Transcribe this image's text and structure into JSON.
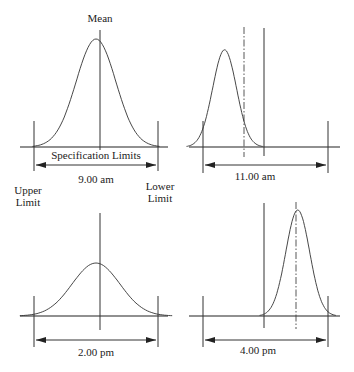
{
  "labels": {
    "mean": "Mean",
    "spec_limits": "Specification Limits",
    "upper_limit_1": "Upper",
    "upper_limit_2": "Limit",
    "lower_limit_1": "Lower",
    "lower_limit_2": "Limit"
  },
  "panels": [
    {
      "id": "p1",
      "time": "9.00 am",
      "mean_offset": 0.0,
      "spread": 1.0,
      "height": 1.0,
      "target_style": "solid",
      "shift_line": false
    },
    {
      "id": "p2",
      "time": "11.00 am",
      "mean_offset": -0.33,
      "spread": 0.6,
      "height": 0.9,
      "target_style": "dashdot",
      "shift_line": true
    },
    {
      "id": "p3",
      "time": "2.00 pm",
      "mean_offset": 0.0,
      "spread": 1.2,
      "height": 0.5,
      "target_style": "solid",
      "shift_line": false
    },
    {
      "id": "p4",
      "time": "4.00 pm",
      "mean_offset": 0.26,
      "spread": 0.6,
      "height": 1.0,
      "target_style": "dashdot",
      "shift_line": true
    }
  ]
}
